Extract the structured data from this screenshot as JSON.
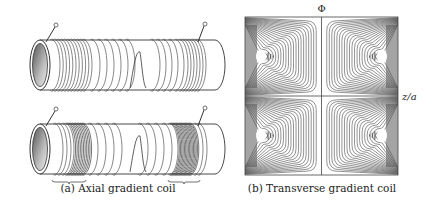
{
  "figure": {
    "panel_a": {
      "caption": "(a) Axial gradient coil",
      "coils": [
        "top",
        "bottom"
      ]
    },
    "panel_b": {
      "caption": "(b) Transverse gradient coil",
      "vertical_axis_label": "Φ",
      "horizontal_axis_label": "z/a"
    }
  },
  "colors": {
    "ink": "#333333",
    "wire": "#555555",
    "dense": "#3a3a3a"
  }
}
